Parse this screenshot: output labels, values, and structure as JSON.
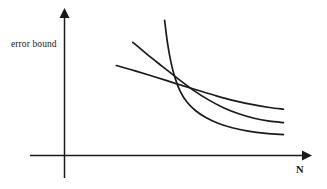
{
  "chart_data": {
    "type": "line",
    "title": "",
    "subtitle": "",
    "xlabel": "N",
    "ylabel": "error bound",
    "grid": false,
    "legend": false,
    "legend_position": "none",
    "axis_style": "arrow-terminated",
    "tick_labels": {
      "x": [],
      "y": []
    },
    "xlim": [
      0,
      1
    ],
    "ylim": [
      0,
      1
    ],
    "annotations": [],
    "series": [
      {
        "name": "steep-decay-curve",
        "style": "solid",
        "color": "#1a1a1a",
        "points": [
          [
            0.425,
            0.955
          ],
          [
            0.437,
            0.8
          ],
          [
            0.452,
            0.66
          ],
          [
            0.47,
            0.545
          ],
          [
            0.492,
            0.452
          ],
          [
            0.52,
            0.378
          ],
          [
            0.556,
            0.318
          ],
          [
            0.6,
            0.268
          ],
          [
            0.652,
            0.228
          ],
          [
            0.712,
            0.196
          ],
          [
            0.78,
            0.172
          ],
          [
            0.855,
            0.156
          ],
          [
            0.93,
            0.148
          ]
        ]
      },
      {
        "name": "middle-curve",
        "style": "solid",
        "color": "#1a1a1a",
        "points": [
          [
            0.29,
            0.8
          ],
          [
            0.35,
            0.716
          ],
          [
            0.415,
            0.63
          ],
          [
            0.48,
            0.545
          ],
          [
            0.545,
            0.464
          ],
          [
            0.61,
            0.395
          ],
          [
            0.675,
            0.338
          ],
          [
            0.74,
            0.295
          ],
          [
            0.805,
            0.263
          ],
          [
            0.87,
            0.243
          ],
          [
            0.93,
            0.233
          ]
        ]
      },
      {
        "name": "shallow-curve",
        "style": "solid",
        "color": "#1a1a1a",
        "points": [
          [
            0.22,
            0.636
          ],
          [
            0.3,
            0.598
          ],
          [
            0.385,
            0.555
          ],
          [
            0.47,
            0.51
          ],
          [
            0.555,
            0.466
          ],
          [
            0.64,
            0.424
          ],
          [
            0.72,
            0.388
          ],
          [
            0.8,
            0.359
          ],
          [
            0.87,
            0.339
          ],
          [
            0.93,
            0.327
          ]
        ]
      }
    ]
  },
  "figure": {
    "background_color": "#ffffff",
    "ink_color": "#1a1a1a"
  }
}
